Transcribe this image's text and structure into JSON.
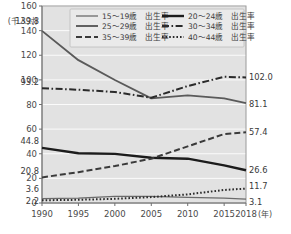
{
  "chart_data": {
    "type": "line",
    "title": "",
    "xlabel": "(年)",
    "ylabel": "(千人対)",
    "ylim": [
      0,
      160
    ],
    "grid": true,
    "legend_position": "top-inside",
    "x": [
      1990,
      1995,
      2000,
      2005,
      2010,
      2015,
      2018
    ],
    "categories": [
      "1990",
      "1995",
      "2000",
      "2005",
      "2010",
      "2015",
      "2018"
    ],
    "yticks": [
      0,
      20,
      40,
      60,
      80,
      100,
      120,
      140,
      160
    ],
    "series": [
      {
        "name": "15～19歳 出生率",
        "style": "solid-thin",
        "color": "#6b6b6b",
        "values": [
          3.6,
          3.9,
          5.4,
          5.4,
          4.6,
          4.0,
          3.1
        ],
        "start_label": "3.6",
        "end_label": "3.1"
      },
      {
        "name": "20～24歳 出生率",
        "style": "solid-thick",
        "color": "#1c1c1c",
        "values": [
          44.8,
          40.4,
          39.9,
          36.7,
          36.0,
          30.6,
          26.6
        ],
        "start_label": "44.8",
        "end_label": "26.6"
      },
      {
        "name": "25～29歳 出生率",
        "style": "solid-medium",
        "color": "#5a5a5a",
        "values": [
          139.8,
          116.0,
          99.9,
          85.0,
          87.4,
          85.0,
          81.1
        ],
        "start_label": "139.8",
        "end_label": "81.1"
      },
      {
        "name": "30～34歳 出生率",
        "style": "dash-dot",
        "color": "#2a2a2a",
        "values": [
          93.2,
          92.0,
          90.2,
          85.5,
          95.0,
          102.5,
          102.0
        ],
        "start_label": "93.2",
        "end_label": "102.0"
      },
      {
        "name": "35～39歳 出生率",
        "style": "dashed",
        "color": "#3a3a3a",
        "values": [
          20.8,
          25.0,
          30.0,
          36.0,
          46.0,
          56.0,
          57.4
        ],
        "start_label": "20.8",
        "end_label": "57.4"
      },
      {
        "name": "40～44歳 出生率",
        "style": "dotted",
        "color": "#2a2a2a",
        "values": [
          2.2,
          2.6,
          3.4,
          4.8,
          7.0,
          10.6,
          11.7
        ],
        "start_label": "2.2",
        "end_label": "11.7"
      }
    ],
    "annotations": {
      "left_labels": [
        "139.8",
        "93.2",
        "44.8",
        "20.8",
        "3.6",
        "2.2"
      ],
      "right_labels": [
        "102.0",
        "81.1",
        "57.4",
        "26.6",
        "11.7",
        "3.1"
      ]
    }
  },
  "legend": {
    "entries": [
      {
        "label": "15～19歳　出生率",
        "style": "solid-thin"
      },
      {
        "label": "20～24歳　出生率",
        "style": "solid-thick"
      },
      {
        "label": "25～29歳　出生率",
        "style": "solid-medium"
      },
      {
        "label": "30～34歳　出生率",
        "style": "dash-dot"
      },
      {
        "label": "35～39歳　出生率",
        "style": "dashed"
      },
      {
        "label": "40～44歳　出生率",
        "style": "dotted"
      }
    ]
  },
  "axes": {
    "y_unit": "(千人対)",
    "x_unit": "(年)",
    "y_ticks": [
      "160",
      "140",
      "120",
      "100",
      "80",
      "60",
      "40",
      "20",
      "0"
    ],
    "x_ticks": [
      "1990",
      "1995",
      "2000",
      "2005",
      "2010",
      "2015",
      "2018"
    ]
  }
}
